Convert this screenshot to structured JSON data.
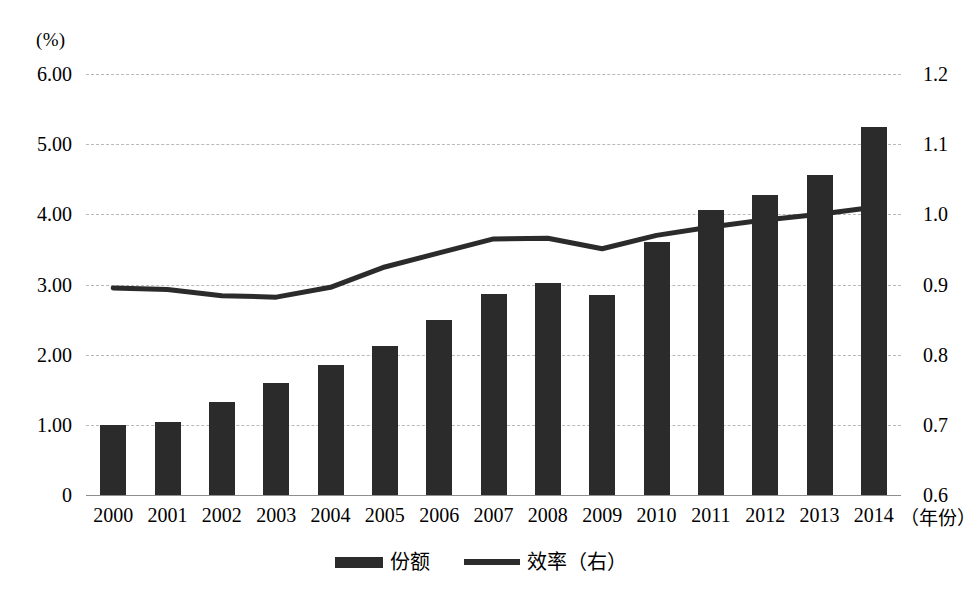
{
  "chart_data": {
    "type": "bar",
    "title": "",
    "subtitle": "",
    "unit_label": "(%)",
    "xlabel": "（年份）",
    "ylabel": "",
    "categories": [
      "2000",
      "2001",
      "2002",
      "2003",
      "2004",
      "2005",
      "2006",
      "2007",
      "2008",
      "2009",
      "2010",
      "2011",
      "2012",
      "2013",
      "2014"
    ],
    "grid": true,
    "legend_position": "bottom",
    "axes": {
      "left": {
        "ticks": [
          "0",
          "1.00",
          "2.00",
          "3.00",
          "4.00",
          "5.00",
          "6.00"
        ],
        "values": [
          0,
          1,
          2,
          3,
          4,
          5,
          6
        ],
        "ylim": [
          0,
          6
        ]
      },
      "right": {
        "ticks": [
          "0.6",
          "0.7",
          "0.8",
          "0.9",
          "1.0",
          "1.1",
          "1.2"
        ],
        "values": [
          0.6,
          0.7,
          0.8,
          0.9,
          1.0,
          1.1,
          1.2
        ],
        "ylim": [
          0.6,
          1.2
        ]
      }
    },
    "series": [
      {
        "name": "份额",
        "type": "bar",
        "axis": "left",
        "color": "#2b2b2b",
        "values": [
          1.0,
          1.04,
          1.33,
          1.6,
          1.85,
          2.13,
          2.5,
          2.87,
          3.02,
          2.85,
          3.6,
          4.06,
          4.27,
          4.56,
          5.25
        ]
      },
      {
        "name": "效率（右）",
        "type": "line",
        "axis": "right",
        "color": "#2b2b2b",
        "values": [
          0.895,
          0.893,
          0.884,
          0.882,
          0.896,
          0.925,
          0.945,
          0.965,
          0.966,
          0.951,
          0.97,
          0.982,
          0.992,
          1.0,
          1.01
        ]
      }
    ]
  },
  "legend": {
    "items": [
      {
        "label": "份额",
        "marker": "bar-swatch"
      },
      {
        "label": "效率（右）",
        "marker": "line-swatch"
      }
    ]
  }
}
